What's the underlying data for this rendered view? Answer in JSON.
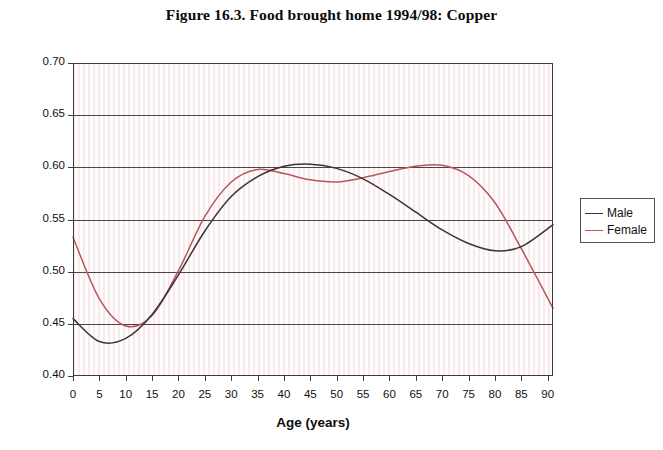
{
  "figure": {
    "title": "Figure 16.3. Food brought home 1994/98: Copper"
  },
  "legend": {
    "entries": [
      {
        "label": "Male",
        "color": "#3a3338"
      },
      {
        "label": "Female",
        "color": "#b9565c"
      }
    ]
  },
  "axes": {
    "y_ticks": [
      "0.70",
      "0.65",
      "0.60",
      "0.55",
      "0.50",
      "0.45",
      "0.40"
    ],
    "x_ticks": [
      "0",
      "5",
      "10",
      "15",
      "20",
      "25",
      "30",
      "35",
      "40",
      "45",
      "50",
      "55",
      "60",
      "65",
      "70",
      "75",
      "80",
      "85",
      "90"
    ]
  },
  "chart_data": {
    "type": "line",
    "title": "Figure 16.3. Food brought home 1994/98: Copper",
    "xlabel": "Age (years)",
    "ylabel": "mg per 1000 kcal",
    "xlim": [
      0,
      91
    ],
    "ylim": [
      0.4,
      0.7
    ],
    "ytick_values": [
      0.4,
      0.45,
      0.5,
      0.55,
      0.6,
      0.65,
      0.7
    ],
    "xtick_values": [
      0,
      5,
      10,
      15,
      20,
      25,
      30,
      35,
      40,
      45,
      50,
      55,
      60,
      65,
      70,
      75,
      80,
      85,
      90
    ],
    "grid": "horizontal",
    "legend_position": "right",
    "x": [
      0,
      5,
      10,
      15,
      20,
      25,
      30,
      35,
      40,
      45,
      50,
      55,
      60,
      65,
      70,
      75,
      80,
      85,
      91
    ],
    "series": [
      {
        "name": "Male",
        "color": "#3a3338",
        "values": [
          0.455,
          0.433,
          0.436,
          0.459,
          0.497,
          0.539,
          0.572,
          0.591,
          0.601,
          0.603,
          0.599,
          0.589,
          0.574,
          0.557,
          0.54,
          0.527,
          0.52,
          0.524,
          0.545
        ]
      },
      {
        "name": "Female",
        "color": "#b9565c",
        "values": [
          0.533,
          0.474,
          0.448,
          0.458,
          0.501,
          0.553,
          0.586,
          0.598,
          0.594,
          0.588,
          0.586,
          0.59,
          0.596,
          0.601,
          0.602,
          0.592,
          0.566,
          0.522,
          0.465
        ]
      }
    ]
  }
}
